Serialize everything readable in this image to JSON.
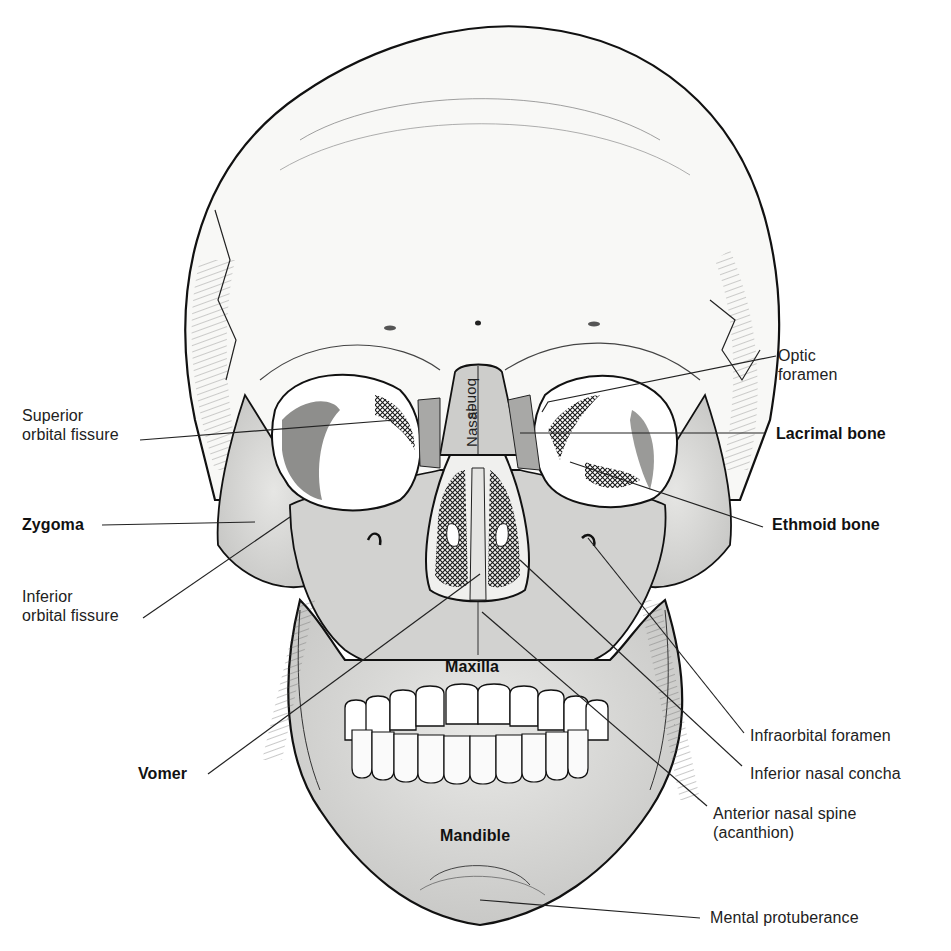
{
  "figure": {
    "colors": {
      "background": "#ffffff",
      "bone_light": "#f7f7f5",
      "bone_shaded": "#cfcfcd",
      "bone_dark": "#a9a9a7",
      "outline": "#111111",
      "leader": "#222222"
    }
  },
  "labels": [
    {
      "id": "optic-foramen",
      "text": "Optic\nforamen",
      "x": 778,
      "y": 346,
      "weight": "normal",
      "line": [
        [
          776,
          356
        ],
        [
          548,
          402
        ],
        [
          542,
          412
        ]
      ]
    },
    {
      "id": "superior-orbital-fissure",
      "text": "Superior\norbital fissure",
      "x": 22,
      "y": 406,
      "weight": "normal",
      "line": [
        [
          140,
          440
        ],
        [
          395,
          420
        ]
      ]
    },
    {
      "id": "lacrimal-bone",
      "text": "Lacrimal bone",
      "x": 776,
      "y": 424,
      "weight": "bold",
      "line": [
        [
          765,
          433
        ],
        [
          520,
          433
        ]
      ]
    },
    {
      "id": "zygoma",
      "text": "Zygoma",
      "x": 22,
      "y": 515,
      "weight": "bold",
      "line": [
        [
          102,
          525
        ],
        [
          255,
          522
        ]
      ]
    },
    {
      "id": "ethmoid-bone",
      "text": "Ethmoid bone",
      "x": 772,
      "y": 515,
      "weight": "bold",
      "line": [
        [
          763,
          527
        ],
        [
          570,
          462
        ]
      ]
    },
    {
      "id": "inferior-orbital-fissure",
      "text": "Inferior\norbital fissure",
      "x": 22,
      "y": 587,
      "weight": "normal",
      "line": [
        [
          143,
          618
        ],
        [
          290,
          517
        ]
      ]
    },
    {
      "id": "maxilla",
      "text": "Maxilla",
      "x": 445,
      "y": 657,
      "weight": "inner",
      "line": null
    },
    {
      "id": "infraorbital-foramen",
      "text": "Infraorbital foramen",
      "x": 750,
      "y": 726,
      "weight": "normal",
      "line": [
        [
          744,
          733
        ],
        [
          588,
          538
        ]
      ]
    },
    {
      "id": "inferior-nasal-concha",
      "text": "Inferior nasal concha",
      "x": 750,
      "y": 764,
      "weight": "normal",
      "line": [
        [
          742,
          766
        ],
        [
          520,
          560
        ]
      ]
    },
    {
      "id": "vomer",
      "text": "Vomer",
      "x": 138,
      "y": 764,
      "weight": "bold",
      "line": [
        [
          208,
          774
        ],
        [
          480,
          574
        ]
      ]
    },
    {
      "id": "anterior-nasal-spine",
      "text": "Anterior nasal spine\n(acanthion)",
      "x": 713,
      "y": 804,
      "weight": "normal",
      "line": [
        [
          707,
          806
        ],
        [
          482,
          612
        ]
      ]
    },
    {
      "id": "mandible",
      "text": "Mandible",
      "x": 440,
      "y": 826,
      "weight": "inner",
      "line": null
    },
    {
      "id": "mental-protuberance",
      "text": "Mental protuberance",
      "x": 710,
      "y": 908,
      "weight": "normal",
      "line": [
        [
          700,
          918
        ],
        [
          480,
          900
        ]
      ]
    }
  ],
  "vertical_labels": [
    {
      "id": "nasal",
      "text": "Nasal",
      "x": 462,
      "y": 447
    },
    {
      "id": "bones",
      "text": "bones",
      "x": 483,
      "y": 378
    }
  ]
}
